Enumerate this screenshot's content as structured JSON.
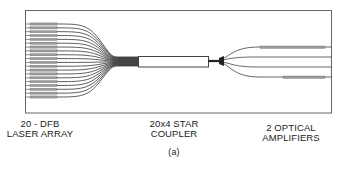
{
  "figure": {
    "caption": "(a)",
    "colors": {
      "line": "#444444",
      "frame": "#666666",
      "amplifier": "#999999",
      "background": "#ffffff"
    }
  },
  "components": {
    "laser_array": {
      "line1": "20 - DFB",
      "line2": "LASER ARRAY",
      "count": 20
    },
    "star_coupler": {
      "line1": "20x4 STAR",
      "line2": "COUPLER",
      "inputs": 20,
      "outputs": 4
    },
    "optical_amplifiers": {
      "line1": "2 OPTICAL",
      "line2": "AMPLIFIERS",
      "count": 2
    }
  }
}
